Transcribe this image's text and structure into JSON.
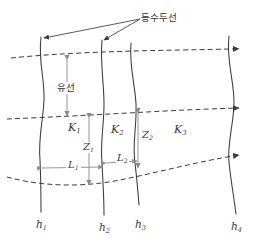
{
  "figure": {
    "type": "flow-net-diagram",
    "background_color": "#ffffff",
    "line_color": "#3c3c3c",
    "dash_color": "#3c3c3c",
    "dimension_color": "#8a8a8a",
    "text_color": "#3a3a3a"
  },
  "annotations": {
    "equipotential_label": "등수두선",
    "flowline_label": "유선"
  },
  "zones": [
    {
      "id": "K1",
      "base": "K",
      "sub": "1"
    },
    {
      "id": "K2",
      "base": "K",
      "sub": "2"
    },
    {
      "id": "K3",
      "base": "K",
      "sub": "3"
    }
  ],
  "heads": [
    {
      "id": "h1",
      "base": "h",
      "sub": "1"
    },
    {
      "id": "h2",
      "base": "h",
      "sub": "2"
    },
    {
      "id": "h3",
      "base": "h",
      "sub": "3"
    },
    {
      "id": "h4",
      "base": "h",
      "sub": "4"
    }
  ],
  "lengths": [
    {
      "id": "L1",
      "base": "L",
      "sub": "1"
    },
    {
      "id": "L2",
      "base": "L",
      "sub": "2"
    }
  ],
  "depths": [
    {
      "id": "Z1",
      "base": "Z",
      "sub": "1"
    },
    {
      "id": "Z2",
      "base": "Z",
      "sub": "2"
    }
  ],
  "flow_arrows": {
    "count": 3,
    "direction": "right"
  },
  "equipotential_lines": {
    "count": 4,
    "orientation": "vertical-curved"
  }
}
